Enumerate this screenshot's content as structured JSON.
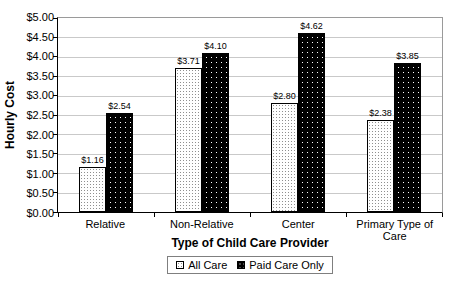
{
  "chart_data": {
    "type": "bar",
    "title": "",
    "xlabel": "Type of Child Care Provider",
    "ylabel": "Hourly Cost",
    "categories": [
      "Relative",
      "Non-Relative",
      "Center",
      "Primary Type of Care"
    ],
    "series": [
      {
        "name": "All Care",
        "values": [
          1.16,
          3.71,
          2.8,
          2.38
        ],
        "labels": [
          "$1.16",
          "$3.71",
          "$2.80",
          "$2.38"
        ],
        "swatch": "white-stipple-pattern"
      },
      {
        "name": "Paid Care Only",
        "values": [
          2.54,
          4.1,
          4.62,
          3.85
        ],
        "labels": [
          "$2.54",
          "$4.10",
          "$4.62",
          "$3.85"
        ],
        "swatch": "black-stipple-pattern"
      }
    ],
    "ylim": [
      0,
      5
    ],
    "ytick_step": 0.5,
    "ytick_labels_top_to_bottom": [
      "$5.00",
      "$4.50",
      "$4.00",
      "$3.50",
      "$3.00",
      "$2.50",
      "$2.00",
      "$1.50",
      "$1.00",
      "$0.50",
      "$0.00"
    ],
    "grid": "horizontal",
    "legend_position": "bottom-center",
    "colors": {
      "all_care_fill": "#ffffff",
      "all_care_dots": "#8f8f8f",
      "paid_care_fill": "#000000",
      "paid_care_dots": "#ffffff",
      "gridline": "#c9c9c9",
      "axis": "#000000",
      "plot_border": "#9a9a9a"
    }
  }
}
